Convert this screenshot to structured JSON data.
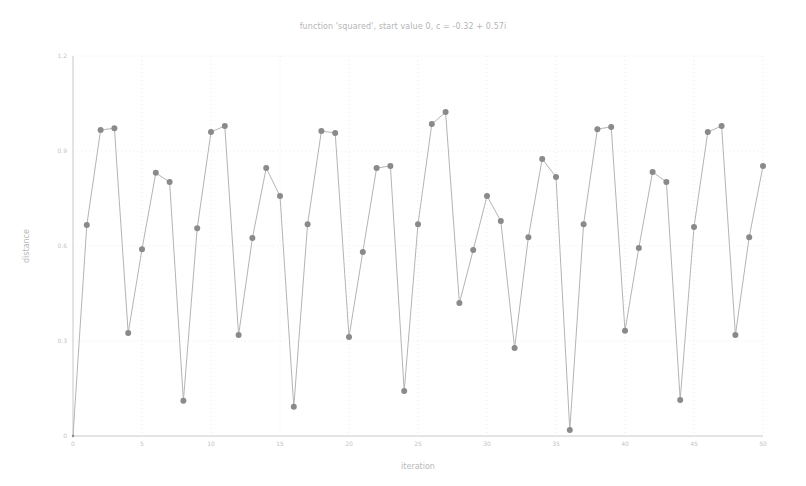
{
  "chart_data": {
    "type": "line",
    "title": "function 'squared', start value 0, c = -0.32 + 0.57i",
    "xlabel": "iteration",
    "ylabel": "distance",
    "xlim": [
      0,
      50
    ],
    "ylim": [
      0,
      1.2
    ],
    "xticks": [
      0,
      5,
      10,
      15,
      20,
      25,
      30,
      35,
      40,
      45,
      50
    ],
    "yticks": [
      0,
      0.3,
      0.6,
      0.9,
      1.2
    ],
    "ytick_labels": [
      "0",
      "0.3",
      "0.6",
      "0.9",
      "1.2"
    ],
    "grid": true,
    "markers": true,
    "series": [
      {
        "name": "distance",
        "color": "#8a8a8a",
        "x": [
          0,
          1,
          2,
          3,
          4,
          5,
          6,
          7,
          8,
          9,
          10,
          11,
          12,
          13,
          14,
          15,
          16,
          17,
          18,
          19,
          20,
          21,
          22,
          23,
          24,
          25,
          26,
          27,
          28,
          29,
          30,
          31,
          32,
          33,
          34,
          35,
          36,
          37,
          38,
          39,
          40,
          41,
          42,
          43,
          44,
          45,
          46,
          47,
          48,
          49,
          50
        ],
        "values": [
          0,
          0.666,
          0.966,
          0.972,
          0.325,
          0.59,
          0.831,
          0.802,
          0.111,
          0.656,
          0.96,
          0.979,
          0.319,
          0.625,
          0.846,
          0.758,
          0.092,
          0.669,
          0.963,
          0.957,
          0.313,
          0.581,
          0.846,
          0.853,
          0.142,
          0.669,
          0.985,
          1.023,
          0.42,
          0.587,
          0.758,
          0.679,
          0.278,
          0.628,
          0.875,
          0.818,
          0.019,
          0.669,
          0.969,
          0.976,
          0.332,
          0.594,
          0.834,
          0.802,
          0.114,
          0.66,
          0.96,
          0.979,
          0.319,
          0.628,
          0.853
        ]
      }
    ]
  },
  "colors": {
    "axis": "#c8c8c8",
    "grid": "#ececec",
    "line": "#b4b4b4",
    "marker": "#8a8a8a"
  }
}
